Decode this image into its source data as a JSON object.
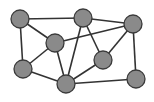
{
  "diagram": {
    "type": "undirected-graph",
    "width": 154,
    "height": 102,
    "colors": {
      "background": "#ffffff",
      "node_fill": "#8a8a8a",
      "node_stroke": "#3a3a3a",
      "edge": "#333333"
    },
    "node_radius": 9,
    "nodes": [
      {
        "id": "A",
        "x": 20,
        "y": 19
      },
      {
        "id": "B",
        "x": 83,
        "y": 18
      },
      {
        "id": "C",
        "x": 133,
        "y": 24
      },
      {
        "id": "D",
        "x": 55,
        "y": 43
      },
      {
        "id": "E",
        "x": 103,
        "y": 60
      },
      {
        "id": "F",
        "x": 23,
        "y": 69
      },
      {
        "id": "G",
        "x": 66,
        "y": 84
      },
      {
        "id": "H",
        "x": 136,
        "y": 79
      }
    ],
    "edges": [
      [
        "A",
        "B"
      ],
      [
        "B",
        "C"
      ],
      [
        "A",
        "D"
      ],
      [
        "A",
        "F"
      ],
      [
        "D",
        "C"
      ],
      [
        "D",
        "F"
      ],
      [
        "D",
        "G"
      ],
      [
        "B",
        "G"
      ],
      [
        "B",
        "E"
      ],
      [
        "C",
        "E"
      ],
      [
        "C",
        "H"
      ],
      [
        "F",
        "G"
      ],
      [
        "G",
        "E"
      ],
      [
        "G",
        "H"
      ]
    ]
  }
}
